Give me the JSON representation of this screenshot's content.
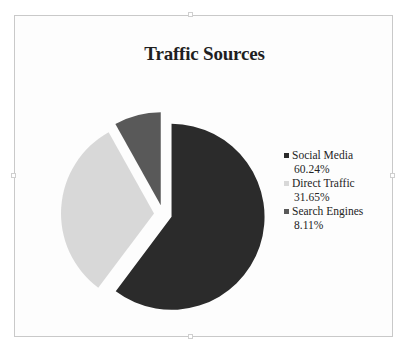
{
  "chart_data": {
    "type": "pie",
    "title": "Traffic Sources",
    "exploded": true,
    "legend_position": "right",
    "grid": false,
    "xlabel": "",
    "ylabel": "",
    "categories": [
      "Social Media",
      "Direct Traffic",
      "Search Engines"
    ],
    "values": [
      60.24,
      31.65,
      8.11
    ],
    "value_labels": [
      "60.24%",
      "31.65%",
      "8.11%"
    ],
    "colors": [
      "#2b2b2b",
      "#d8d8d8",
      "#595959"
    ],
    "slices": [
      {
        "label": "Social Media",
        "value": 60.24,
        "value_label": "60.24%",
        "color": "#2b2b2b"
      },
      {
        "label": "Direct Traffic",
        "value": 31.65,
        "value_label": "31.65%",
        "color": "#d8d8d8"
      },
      {
        "label": "Search Engines",
        "value": 8.11,
        "value_label": "8.11%",
        "color": "#595959"
      }
    ]
  },
  "legend": {
    "entries": [
      {
        "label": "Social Media",
        "value_label": "60.24%",
        "color": "#2b2b2b"
      },
      {
        "label": "Direct Traffic",
        "value_label": "31.65%",
        "color": "#d8d8d8"
      },
      {
        "label": "Search Engines",
        "value_label": "8.11%",
        "color": "#595959"
      }
    ]
  },
  "frame": {
    "border_color": "#c9c9c9",
    "background": "#fdfdfd"
  }
}
